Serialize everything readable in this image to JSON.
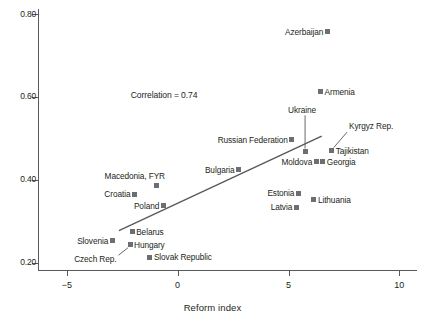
{
  "chart_data": {
    "type": "scatter",
    "title": "",
    "xlabel": "Reform index",
    "ylabel": "",
    "xlim": [
      -6.3,
      10.8
    ],
    "ylim": [
      0.182,
      0.812
    ],
    "grid": false,
    "legend": "none",
    "xticks": [
      -5,
      0,
      5,
      10
    ],
    "xticklabels": [
      "−5",
      "0",
      "5",
      "10"
    ],
    "yticks": [
      0.2,
      0.4,
      0.6,
      0.8
    ],
    "yticklabels": [
      "0.20",
      "0.40",
      "0.60",
      "0.80"
    ],
    "annotations": [
      {
        "text": "Correlation = 0.74",
        "x": -0.9,
        "y": 0.605
      }
    ],
    "trendline": {
      "x": [
        -2.65,
        6.5
      ],
      "y": [
        0.277,
        0.505
      ]
    },
    "points": [
      {
        "label": "Azerbaijan",
        "x": 6.75,
        "y": 0.757,
        "label_side": "left"
      },
      {
        "label": "Armenia",
        "x": 6.45,
        "y": 0.612,
        "label_side": "right"
      },
      {
        "label": "Ukraine",
        "x": 5.75,
        "y": 0.468,
        "label_side": "leader-up",
        "label_x": 5.75,
        "label_y": 0.565
      },
      {
        "label": "Russian Federation",
        "x": 5.15,
        "y": 0.497,
        "label_side": "left"
      },
      {
        "label": "Kyrgyz Rep.",
        "x": 6.95,
        "y": 0.47,
        "label_side": "leader-ne",
        "label_x": 8.55,
        "label_y": 0.527
      },
      {
        "label": "Tajikistan",
        "x": 6.95,
        "y": 0.47,
        "label_side": "right"
      },
      {
        "label": "Georgia",
        "x": 6.55,
        "y": 0.443,
        "label_side": "right"
      },
      {
        "label": "Moldova",
        "x": 6.25,
        "y": 0.443,
        "label_side": "left"
      },
      {
        "label": "Bulgaria",
        "x": 2.75,
        "y": 0.424,
        "label_side": "left"
      },
      {
        "label": "Macedonia, FYR",
        "x": -0.95,
        "y": 0.387,
        "label_side": "above"
      },
      {
        "label": "Croatia",
        "x": -1.95,
        "y": 0.365,
        "label_side": "left"
      },
      {
        "label": "Estonia",
        "x": 5.45,
        "y": 0.367,
        "label_side": "left"
      },
      {
        "label": "Lithuania",
        "x": 6.15,
        "y": 0.352,
        "label_side": "right"
      },
      {
        "label": "Poland",
        "x": -0.65,
        "y": 0.337,
        "label_side": "left"
      },
      {
        "label": "Latvia",
        "x": 5.35,
        "y": 0.334,
        "label_side": "left"
      },
      {
        "label": "Belarus",
        "x": -2.05,
        "y": 0.275,
        "label_side": "right"
      },
      {
        "label": "Slovenia",
        "x": -2.95,
        "y": 0.253,
        "label_side": "left"
      },
      {
        "label": "Hungary",
        "x": -2.15,
        "y": 0.243,
        "label_side": "right"
      },
      {
        "label": "Czech Rep.",
        "x": -2.15,
        "y": 0.243,
        "label_side": "leader-sw",
        "label_x": -3.75,
        "label_y": 0.208
      },
      {
        "label": "Slovak Republic",
        "x": -1.25,
        "y": 0.213,
        "label_side": "right"
      }
    ]
  },
  "style": {
    "marker_color": "#6d6e71",
    "line_color": "#58595b",
    "text_color": "#231f20",
    "background": "#ffffff"
  }
}
